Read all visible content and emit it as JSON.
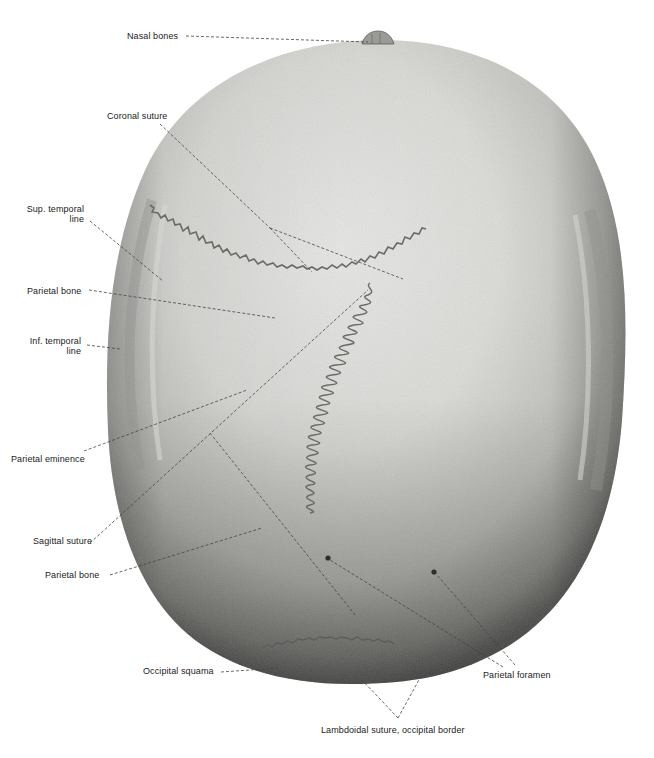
{
  "figure": {
    "view": "Skull, superior view (norma verticalis)",
    "colors": {
      "background": "#ffffff",
      "bone_light": "#e6e6e3",
      "bone_mid": "#bdbdb9",
      "bone_dark": "#6e6e6b",
      "suture": "#6b6b68",
      "leader": "#444444",
      "text": "#222222"
    }
  },
  "labels": {
    "nasal_bones": "Nasal bones",
    "coronal_suture": "Coronal suture",
    "sup_temporal_line_1": "Sup. temporal",
    "sup_temporal_line_2": "line",
    "parietal_bone_upper": "Parietal bone",
    "inf_temporal_line_1": "Inf. temporal",
    "inf_temporal_line_2": "line",
    "parietal_eminence": "Parietal eminence",
    "sagittal_suture": "Sagittal suture",
    "parietal_bone_lower": "Parietal bone",
    "occipital_squama": "Occipital squama",
    "parietal_foramen": "Parietal foramen",
    "lambdoidal_suture": "Lambdoidal suture, occipital border"
  }
}
